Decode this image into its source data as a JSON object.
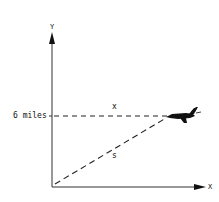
{
  "diagram": {
    "y_axis_label": "Y",
    "x_axis_label": "X",
    "height_label": "6 miles",
    "horizontal_segment_label": "x",
    "hypotenuse_label": "s",
    "object": "airplane-icon",
    "colors": {
      "ink": "#111111",
      "background": "#ffffff"
    }
  }
}
